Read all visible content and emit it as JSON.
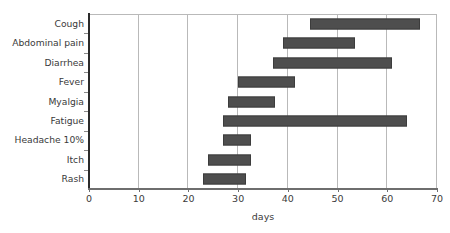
{
  "chart_data": {
    "type": "bar",
    "orientation": "horizontal",
    "subtype": "range-bar",
    "title": "",
    "xlabel": "days",
    "ylabel": "",
    "xlim": [
      0,
      70
    ],
    "xticks": [
      0,
      10,
      20,
      30,
      40,
      50,
      60,
      70
    ],
    "grid": "vertical",
    "legend": "none",
    "categories": [
      "Cough",
      "Abdominal pain",
      "Diarrhea",
      "Fever",
      "Myalgia",
      "Fatigue",
      "Headache 10%",
      "Itch",
      "Rash"
    ],
    "bars": [
      {
        "category": "Cough",
        "start": 44.5,
        "end": 66.5
      },
      {
        "category": "Abdominal pain",
        "start": 39.0,
        "end": 53.5
      },
      {
        "category": "Diarrhea",
        "start": 37.0,
        "end": 61.0
      },
      {
        "category": "Fever",
        "start": 30.0,
        "end": 41.5
      },
      {
        "category": "Myalgia",
        "start": 28.0,
        "end": 37.5
      },
      {
        "category": "Fatigue",
        "start": 27.0,
        "end": 64.0
      },
      {
        "category": "Headache 10%",
        "start": 27.0,
        "end": 32.5
      },
      {
        "category": "Itch",
        "start": 24.0,
        "end": 32.5
      },
      {
        "category": "Rash",
        "start": 23.0,
        "end": 31.5
      }
    ],
    "colors": {
      "bar_fill": "#4e4e4e",
      "bar_border": "#3c3c3c",
      "gridline": "#b9b9b9",
      "axis": "#2b2b2b",
      "text": "#3a3a3a",
      "background": "#ffffff"
    }
  }
}
